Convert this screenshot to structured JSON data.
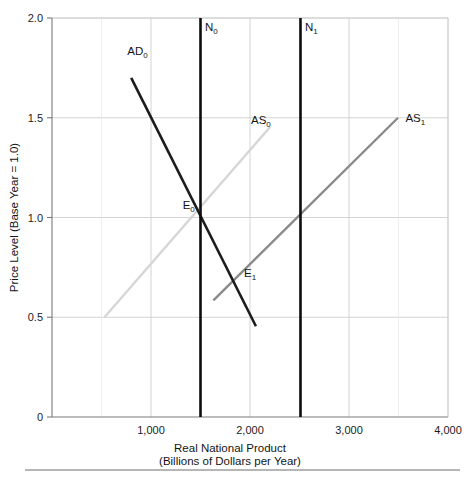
{
  "chart_data": {
    "type": "line",
    "title": "",
    "xlabel": "Real National Product",
    "xlabel_sub": "(Billions of Dollars per Year)",
    "ylabel": "Price Level (Base Year = 1.0)",
    "xlim": [
      0,
      4000
    ],
    "ylim": [
      0,
      2.0
    ],
    "grid": true,
    "legend": "inline-labels",
    "xticks": [
      {
        "value": 1000,
        "label": "1,000"
      },
      {
        "value": 2000,
        "label": "2,000"
      },
      {
        "value": 3000,
        "label": "3,000"
      },
      {
        "value": 4000,
        "label": "4,000"
      }
    ],
    "yticks": [
      {
        "value": 0,
        "label": "0"
      },
      {
        "value": 0.5,
        "label": "0.5"
      },
      {
        "value": 1.0,
        "label": "1.0"
      },
      {
        "value": 1.5,
        "label": "1.5"
      },
      {
        "value": 2.0,
        "label": "2.0"
      }
    ],
    "series": [
      {
        "name": "AD0",
        "label": "AD",
        "label_sub": "0",
        "kind": "aggregate-demand",
        "color": "#1c1c1c",
        "width": 2.6,
        "points": [
          [
            800,
            1.7
          ],
          [
            2060,
            0.455
          ]
        ],
        "label_pos": [
          760,
          1.815
        ]
      },
      {
        "name": "AS0",
        "label": "AS",
        "label_sub": "0",
        "kind": "aggregate-supply-original",
        "color": "#d6d6d6",
        "width": 2.4,
        "points": [
          [
            530,
            0.5
          ],
          [
            2205,
            1.455
          ]
        ],
        "label_pos": [
          2010,
          1.47
        ]
      },
      {
        "name": "AS1",
        "label": "AS",
        "label_sub": "1",
        "kind": "aggregate-supply-shifted",
        "color": "#8a8a8a",
        "width": 2.4,
        "points": [
          [
            1630,
            0.585
          ],
          [
            3495,
            1.5
          ]
        ],
        "label_pos": [
          3570,
          1.48
        ]
      },
      {
        "name": "N0",
        "label": "N",
        "label_sub": "0",
        "kind": "natural-output-original",
        "color": "#0d0d0d",
        "width": 2.6,
        "points": [
          [
            1500,
            0
          ],
          [
            1500,
            2.0
          ]
        ],
        "label_pos": [
          1545,
          1.935
        ]
      },
      {
        "name": "N1",
        "label": "N",
        "label_sub": "1",
        "kind": "natural-output-new",
        "color": "#0d0d0d",
        "width": 2.6,
        "points": [
          [
            2510,
            0
          ],
          [
            2510,
            2.0
          ]
        ],
        "label_pos": [
          2555,
          1.935
        ]
      }
    ],
    "annotations": [
      {
        "name": "E0",
        "label": "E",
        "label_sub": "0",
        "x": 1500,
        "y": 1.0,
        "label_x": 1320,
        "label_y": 1.045
      },
      {
        "name": "E1",
        "label": "E",
        "label_sub": "1",
        "x": 1840,
        "y": 0.69,
        "label_x": 1940,
        "label_y": 0.7
      }
    ]
  }
}
